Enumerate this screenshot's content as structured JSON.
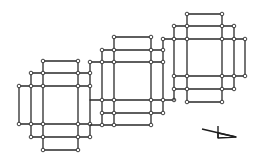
{
  "diagram": {
    "width": 261,
    "height": 160,
    "colors": {
      "line": "#2a2a2a",
      "node_fill": "#ffffff",
      "background": "#ffffff"
    },
    "node_radius": 1.8,
    "structures": [
      {
        "id": "left-grid",
        "edges": [
          [
            43,
            61,
            78,
            61
          ],
          [
            31,
            73,
            90,
            73
          ],
          [
            19,
            86,
            90,
            86
          ],
          [
            19,
            124,
            90,
            124
          ],
          [
            31,
            137,
            90,
            137
          ],
          [
            43,
            150,
            78,
            150
          ],
          [
            19,
            86,
            19,
            124
          ],
          [
            31,
            73,
            31,
            137
          ],
          [
            43,
            61,
            43,
            150
          ],
          [
            78,
            61,
            78,
            150
          ],
          [
            90,
            61,
            90,
            137
          ]
        ],
        "nodes": [
          [
            43,
            61
          ],
          [
            78,
            61
          ],
          [
            31,
            73
          ],
          [
            43,
            73
          ],
          [
            78,
            73
          ],
          [
            90,
            73
          ],
          [
            19,
            86
          ],
          [
            31,
            86
          ],
          [
            43,
            86
          ],
          [
            78,
            86
          ],
          [
            90,
            86
          ],
          [
            19,
            124
          ],
          [
            31,
            124
          ],
          [
            43,
            124
          ],
          [
            78,
            124
          ],
          [
            90,
            124
          ],
          [
            31,
            137
          ],
          [
            43,
            137
          ],
          [
            78,
            137
          ],
          [
            90,
            137
          ],
          [
            43,
            150
          ],
          [
            78,
            150
          ]
        ]
      },
      {
        "id": "middle-grid",
        "edges": [
          [
            114,
            37,
            152,
            37
          ],
          [
            102,
            50,
            163,
            50
          ],
          [
            90,
            62,
            163,
            62
          ],
          [
            90,
            100,
            174,
            100
          ],
          [
            102,
            113,
            163,
            113
          ],
          [
            90,
            125,
            151,
            125
          ],
          [
            102,
            50,
            102,
            125
          ],
          [
            114,
            37,
            114,
            125
          ],
          [
            151,
            37,
            151,
            125
          ],
          [
            163,
            38,
            163,
            113
          ]
        ],
        "nodes": [
          [
            114,
            37
          ],
          [
            151,
            37
          ],
          [
            102,
            50
          ],
          [
            114,
            50
          ],
          [
            151,
            50
          ],
          [
            163,
            50
          ],
          [
            90,
            62
          ],
          [
            102,
            62
          ],
          [
            114,
            62
          ],
          [
            151,
            62
          ],
          [
            163,
            62
          ],
          [
            102,
            100
          ],
          [
            114,
            100
          ],
          [
            151,
            100
          ],
          [
            163,
            100
          ],
          [
            174,
            100
          ],
          [
            102,
            113
          ],
          [
            114,
            113
          ],
          [
            151,
            113
          ],
          [
            163,
            113
          ],
          [
            102,
            125
          ],
          [
            114,
            125
          ],
          [
            151,
            125
          ]
        ]
      },
      {
        "id": "right-grid",
        "edges": [
          [
            187,
            14,
            223,
            14
          ],
          [
            174,
            26,
            234,
            26
          ],
          [
            163,
            39,
            245,
            39
          ],
          [
            174,
            76,
            245,
            76
          ],
          [
            174,
            89,
            234,
            89
          ],
          [
            187,
            102,
            222,
            102
          ],
          [
            174,
            26,
            174,
            100
          ],
          [
            187,
            14,
            187,
            102
          ],
          [
            222,
            14,
            222,
            102
          ],
          [
            234,
            26,
            234,
            89
          ],
          [
            245,
            39,
            245,
            76
          ]
        ],
        "nodes": [
          [
            187,
            14
          ],
          [
            222,
            14
          ],
          [
            174,
            26
          ],
          [
            187,
            26
          ],
          [
            222,
            26
          ],
          [
            234,
            26
          ],
          [
            163,
            39
          ],
          [
            174,
            39
          ],
          [
            187,
            39
          ],
          [
            222,
            39
          ],
          [
            234,
            39
          ],
          [
            245,
            39
          ],
          [
            174,
            76
          ],
          [
            187,
            76
          ],
          [
            222,
            76
          ],
          [
            234,
            76
          ],
          [
            245,
            76
          ],
          [
            174,
            89
          ],
          [
            187,
            89
          ],
          [
            222,
            89
          ],
          [
            234,
            89
          ],
          [
            187,
            102
          ],
          [
            222,
            102
          ]
        ]
      }
    ],
    "north_symbol": {
      "name": "orientation-arrow",
      "line": [
        202,
        129,
        236,
        137
      ],
      "stem": [
        218,
        126,
        218,
        138
      ],
      "triangle": [
        [
          218,
          133
        ],
        [
          236,
          137
        ],
        [
          218,
          138
        ]
      ]
    }
  }
}
